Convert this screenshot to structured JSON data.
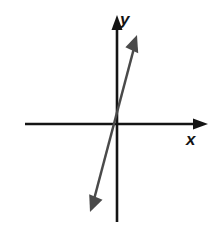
{
  "figure": {
    "background_color": "#ffffff",
    "width": 222,
    "height": 235,
    "axis_color": "#141414",
    "line_color": "#4a4a4a"
  },
  "labels": {
    "y_axis": "y",
    "x_axis": "x"
  },
  "chart_data": {
    "type": "line",
    "title": "",
    "xlabel": "x",
    "ylabel": "y",
    "grid": false,
    "legend": null,
    "axes": {
      "origin_px": [
        116,
        124
      ],
      "x_axis": {
        "start_px": [
          25,
          124
        ],
        "end_px": [
          208,
          124
        ],
        "arrow": "end",
        "label": "x",
        "label_px": [
          190,
          140
        ]
      },
      "y_axis": {
        "start_px": [
          117,
          222
        ],
        "end_px": [
          117,
          15
        ],
        "arrow": "start",
        "label": "y",
        "label_px": [
          126,
          20
        ]
      }
    },
    "series": [
      {
        "name": "line",
        "kind": "straight-line",
        "arrows": "both",
        "through_origin": true,
        "slope_sign": "positive",
        "slope_estimate": 4.3,
        "intercept": 0,
        "endpoints_px": [
          [
            90,
            212
          ],
          [
            137,
            35
          ]
        ],
        "x": [
          -0.28,
          0.23
        ],
        "y": [
          -1.2,
          1.0
        ]
      }
    ],
    "xlim": [
      -1.0,
      1.0
    ],
    "ylim": [
      -1.2,
      1.2
    ]
  }
}
